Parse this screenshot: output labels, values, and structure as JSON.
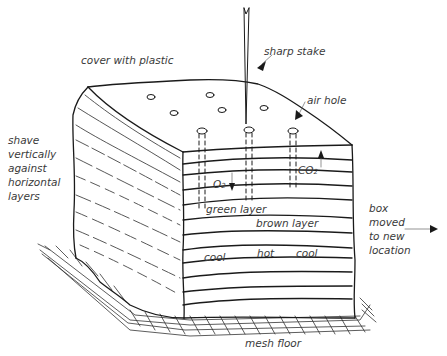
{
  "diagram": {
    "labels": {
      "cover": "cover with plastic",
      "stake": "sharp stake",
      "air_hole": "air hole",
      "shave": "shave\nvertically\nagainst\nhorizontal\nlayers",
      "o2": "O",
      "o2_sub": "2",
      "co2": "CO",
      "co2_sub": "2",
      "green_layer": "green layer",
      "brown_layer": "brown layer",
      "cool_left": "cool",
      "hot": "hot",
      "cool_right": "cool",
      "box_moved": "box\nmoved\nto new\nlocation",
      "mesh_floor": "mesh floor"
    },
    "colors": {
      "line": "#1a1a1a",
      "text": "#3a3a3a",
      "background": "#ffffff"
    }
  }
}
